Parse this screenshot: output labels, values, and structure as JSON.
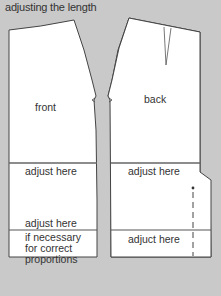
{
  "title": "adjusting the length",
  "front": {
    "label": "front",
    "adjust_1": "adjust here",
    "adjust_2": "adjust here",
    "note_1": "if necessary",
    "note_2": "for correct",
    "note_3": "proportions"
  },
  "back": {
    "label": "back",
    "adjust_1": "adjust here",
    "adjust_2": "adjuct here"
  },
  "colors": {
    "background": "#c9c9c9",
    "pattern": "#ffffff",
    "line": "#444444"
  }
}
